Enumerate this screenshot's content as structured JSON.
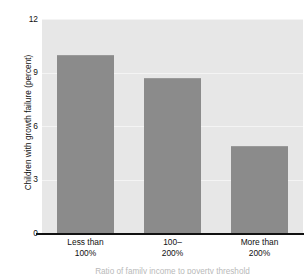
{
  "chart_data": {
    "type": "bar",
    "title": "",
    "subtitle": "",
    "categories": [
      "Less than 100%",
      "100– 200%",
      "More than 200%"
    ],
    "category_lines": [
      [
        "Less than",
        "100%"
      ],
      [
        "100–",
        "200%"
      ],
      [
        "More than",
        "200%"
      ]
    ],
    "values": [
      10.0,
      8.7,
      4.9
    ],
    "series": [
      {
        "name": "Children with growth failure",
        "values": [
          10.0,
          8.7,
          4.9
        ]
      }
    ],
    "xlabel": "Ratio of family income to poverty threshold",
    "ylabel": "Children with growth failure (percent)",
    "ylim": [
      0,
      12
    ],
    "yticks": [
      0,
      3,
      6,
      9,
      12
    ],
    "ytick_labels": [
      "0",
      "3",
      "6",
      "9",
      "12"
    ],
    "xlim": [
      0,
      3
    ],
    "grid": true,
    "grid_axis": "y",
    "legend": false,
    "legend_position": "none",
    "bar_color": "#8b8b8b",
    "plot_background": "#e7e7e7",
    "gridline_color": "#f4f4f4",
    "axis_color": "#111111",
    "figure_background": "#ffffff"
  }
}
